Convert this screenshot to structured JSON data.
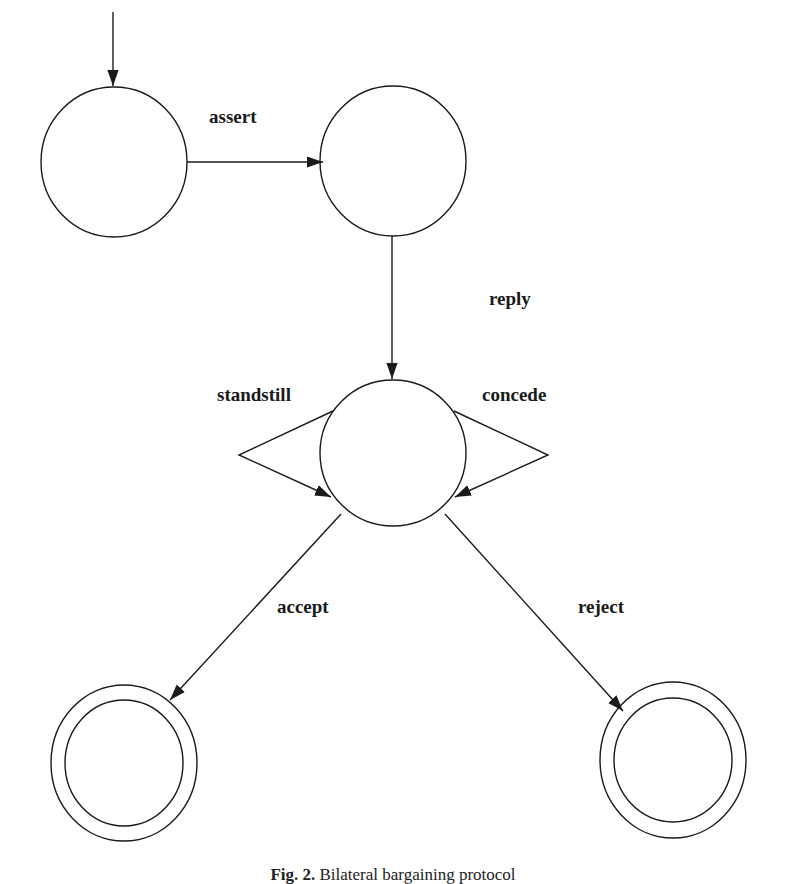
{
  "diagram": {
    "type": "state-machine",
    "states": [
      {
        "id": "s0",
        "role": "initial"
      },
      {
        "id": "s1",
        "role": "intermediate"
      },
      {
        "id": "s2",
        "role": "negotiation"
      },
      {
        "id": "s3",
        "role": "final"
      },
      {
        "id": "s4",
        "role": "final"
      }
    ],
    "transitions": [
      {
        "from": "s0",
        "to": "s1",
        "label": "assert"
      },
      {
        "from": "s1",
        "to": "s2",
        "label": "reply"
      },
      {
        "from": "s2",
        "to": "s2",
        "label": "standstill"
      },
      {
        "from": "s2",
        "to": "s2",
        "label": "concede"
      },
      {
        "from": "s2",
        "to": "s3",
        "label": "accept"
      },
      {
        "from": "s2",
        "to": "s4",
        "label": "reject"
      }
    ],
    "labels": {
      "assert": "assert",
      "reply": "reply",
      "standstill": "standstill",
      "concede": "concede",
      "accept": "accept",
      "reject": "reject"
    },
    "stroke_color": "#1a1a1a"
  },
  "caption": {
    "prefix": "Fig. 2.",
    "text": "Bilateral bargaining protocol"
  }
}
